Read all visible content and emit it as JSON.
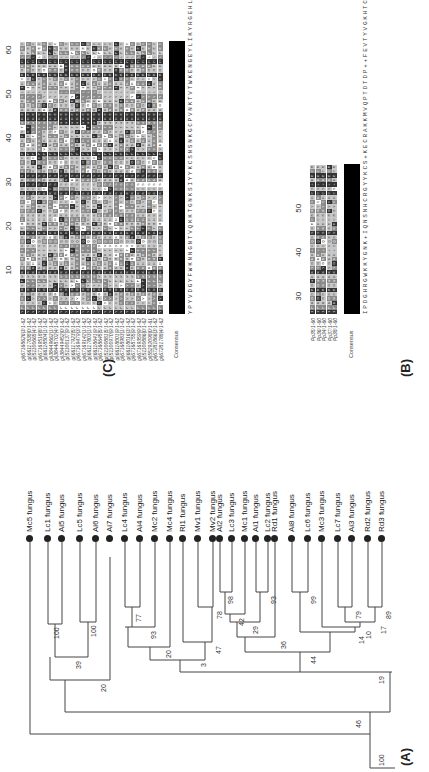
{
  "panels": {
    "A": {
      "label": "(A)"
    },
    "B": {
      "label": "(B)"
    },
    "C": {
      "label": "(C)"
    }
  },
  "tree": {
    "root_bootstrap": "100",
    "leaves": [
      {
        "name": "Mc5 fungus"
      },
      {
        "name": "Lc1 fungus"
      },
      {
        "name": "Ai5 fungus"
      },
      {
        "name": "Lc5 fungus"
      },
      {
        "name": "Ai6 fungus"
      },
      {
        "name": "Ai7 fungus"
      },
      {
        "name": "Lc4 fungus"
      },
      {
        "name": "Ai4 fungus"
      },
      {
        "name": "Mc2 fungus"
      },
      {
        "name": "Mc4 fungus"
      },
      {
        "name": "Ri1 fungus"
      },
      {
        "name": "Mv1 fungus"
      },
      {
        "name": "Mv2 fungus"
      },
      {
        "name": "Ai2 fungus"
      },
      {
        "name": "Lc3 fungus"
      },
      {
        "name": "Mc1 fungus"
      },
      {
        "name": "Ai1 fungus"
      },
      {
        "name": "Lc2 fungus"
      },
      {
        "name": "Rd1 fungus"
      },
      {
        "name": "Ai8 fungus"
      },
      {
        "name": "Lc6 fungus"
      },
      {
        "name": "Mc3 fungus"
      },
      {
        "name": "Lc7 fungus"
      },
      {
        "name": "Ai3 fungus"
      },
      {
        "name": "Rd2 fungus"
      },
      {
        "name": "Rd3 fungus"
      }
    ],
    "bootstraps": [
      "100",
      "46",
      "20",
      "39",
      "100",
      "100",
      "3",
      "20",
      "93",
      "77",
      "47",
      "78",
      "19",
      "44",
      "36",
      "29",
      "42",
      "98",
      "93",
      "14",
      "99",
      "10",
      "79",
      "17",
      "89"
    ]
  },
  "alignment_B": {
    "ticks": [
      "10",
      "20",
      "30",
      "40",
      "50",
      "60"
    ],
    "sequences": [
      "gi|67168626|3/1-62",
      "gi|66117838|0/1-62",
      "gi|51100665|4/1-62",
      "gi|67169518|8/1-62",
      "gi|66118504|1/1-62",
      "gi|38449662|1/1-62",
      "gi|38448702|4/1-62",
      "gi|38449452|0/1-62",
      "gi|51100137|9/1-62",
      "gi|66117923|5/1-62",
      "gi|67169479|3/1-62",
      "gi|67169142|1/1-62",
      "gi|66117803|1/1-62",
      "gi|66118641|9/1-62",
      "gi|67168645|5/1-62",
      "gi|51100881|5/1-62",
      "gi|51100970|9/1-62",
      "gi|66118001|9/1-62",
      "gi|67168983|1/1-62",
      "gi|66118016|3/1-62",
      "gi|67168755|9/1-62",
      "gi|67169359|9/1-62",
      "gi|51100886|0/1-62",
      "gi|55292098|0/1-61",
      "gi|67281866|3/1-62",
      "gi|67281788|4/1-62"
    ],
    "consensus_label": "Consensus",
    "consensus": "YPYVDGYFWKNNGNTVQKKTGNKSIYYKCSNSNKGCPVNKTVTWKENGEYLIKYRGEHLPEC"
  },
  "alignment_C": {
    "ticks": [
      "30",
      "40",
      "50"
    ],
    "sequences": [
      "Pp35/1-60",
      "Pp36/1-60",
      "Pp34/1-60",
      "Pp37/1-60",
      "Pp38/1-60"
    ],
    "consensus_label": "Consensus",
    "consensus": "IPDGHRGWKKYGNK+IQNSNHCRGYYKCS+KECRAKKMVQPTDTDP++FEVTYVGKHTC"
  }
}
